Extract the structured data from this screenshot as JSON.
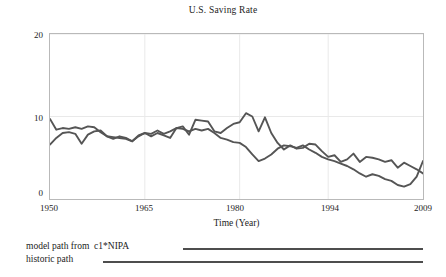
{
  "chart_data": {
    "type": "line",
    "title": "U.S. Saving Rate",
    "xlabel": "Time (Year)",
    "ylabel": "",
    "xlim": [
      1950,
      2009
    ],
    "ylim": [
      0,
      20
    ],
    "xticks": [
      1950,
      1965,
      1980,
      1994,
      2009
    ],
    "xtick_labels": [
      "1950",
      "1965",
      "1980",
      "1994",
      "2009"
    ],
    "yticks": [
      0,
      10,
      20
    ],
    "ytick_labels": [
      "0",
      "10",
      "20"
    ],
    "grid": true,
    "legend_position": "below-axes",
    "x": [
      1950,
      1951,
      1952,
      1953,
      1954,
      1955,
      1956,
      1957,
      1958,
      1959,
      1960,
      1961,
      1962,
      1963,
      1964,
      1965,
      1966,
      1967,
      1968,
      1969,
      1970,
      1971,
      1972,
      1973,
      1974,
      1975,
      1976,
      1977,
      1978,
      1979,
      1980,
      1981,
      1982,
      1983,
      1984,
      1985,
      1986,
      1987,
      1988,
      1989,
      1990,
      1991,
      1992,
      1993,
      1994,
      1995,
      1996,
      1997,
      1998,
      1999,
      2000,
      2001,
      2002,
      2003,
      2004,
      2005,
      2006,
      2007,
      2008,
      2009
    ],
    "series": [
      {
        "name": "model path from  c1*NIPA",
        "color": "#555555",
        "values": [
          6.6,
          7.4,
          8.0,
          8.1,
          7.9,
          6.7,
          7.8,
          8.2,
          8.3,
          7.6,
          7.3,
          7.6,
          7.4,
          7.0,
          7.6,
          8.0,
          7.9,
          8.3,
          7.9,
          8.2,
          8.6,
          8.5,
          8.2,
          8.5,
          8.3,
          8.5,
          8.0,
          7.4,
          7.2,
          6.9,
          6.8,
          6.3,
          5.4,
          4.6,
          4.9,
          5.4,
          6.1,
          6.5,
          6.4,
          6.2,
          6.5,
          6.0,
          5.6,
          5.1,
          4.8,
          4.6,
          4.3,
          4.0,
          3.6,
          3.1,
          2.7,
          3.0,
          2.8,
          2.4,
          2.2,
          1.7,
          1.5,
          1.8,
          2.7,
          4.6
        ]
      },
      {
        "name": "historic path",
        "color": "#555555",
        "values": [
          9.7,
          8.4,
          8.6,
          8.5,
          8.7,
          8.5,
          8.8,
          8.7,
          8.1,
          7.6,
          7.5,
          7.4,
          7.3,
          7.0,
          7.7,
          8.0,
          7.6,
          8.0,
          7.7,
          7.4,
          8.6,
          8.8,
          7.8,
          9.6,
          9.5,
          9.4,
          8.2,
          8.0,
          8.6,
          9.1,
          9.3,
          10.4,
          10.0,
          8.2,
          9.9,
          8.0,
          6.8,
          6.0,
          6.5,
          6.1,
          6.2,
          6.7,
          6.6,
          5.8,
          5.1,
          5.3,
          4.5,
          4.8,
          5.5,
          4.5,
          5.1,
          5.0,
          4.8,
          4.5,
          4.7,
          3.8,
          4.4,
          4.0,
          3.6,
          3.1
        ]
      }
    ]
  },
  "legend": {
    "rows": [
      {
        "label": "model path from  c1*NIPA"
      },
      {
        "label": "historic path"
      }
    ]
  }
}
